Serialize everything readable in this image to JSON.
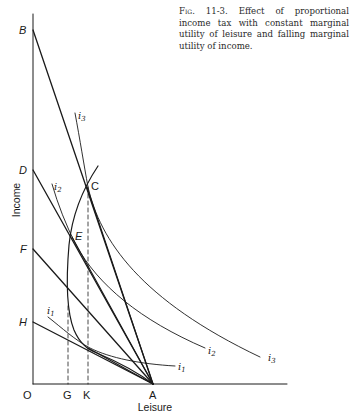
{
  "caption": {
    "figure_number": "Fig. 11-3.",
    "text": "Effect of proportional income tax with constant marginal utility of leisure and falling marginal utility of income."
  },
  "axes": {
    "x_label": "Leisure",
    "y_label": "Income",
    "origin_label": "O"
  },
  "points": {
    "B": "B",
    "D": "D",
    "F": "F",
    "H": "H",
    "C": "C",
    "E": "E",
    "G": "G",
    "K": "K",
    "A": "A"
  },
  "curves": {
    "i1": {
      "base": "i",
      "sub": "1"
    },
    "i2": {
      "base": "i",
      "sub": "2"
    },
    "i3": {
      "base": "i",
      "sub": "3"
    }
  }
}
